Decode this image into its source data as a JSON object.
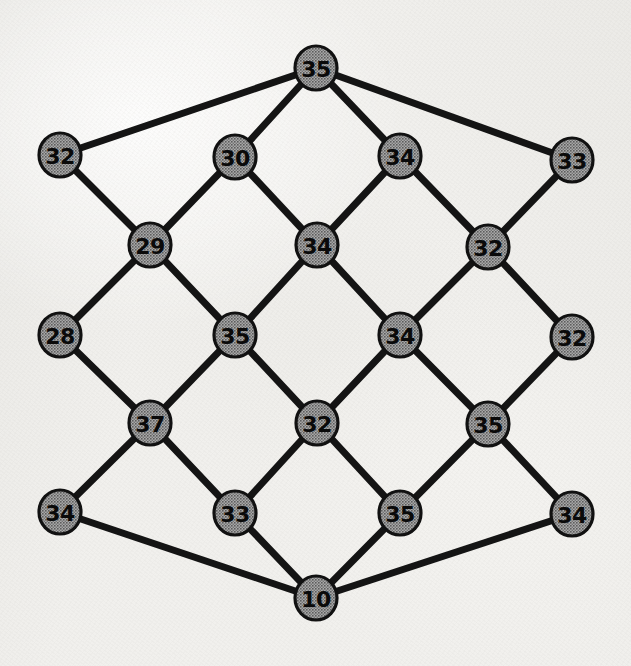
{
  "figure": {
    "kind": "undirected-graph-diagram",
    "medium": "scanned-paper",
    "background_color": "#f1f0ed",
    "node_fill_color": "#8c8c8c",
    "node_stroke_color": "#111111",
    "edge_color": "#141414",
    "label_color": "#0a0a0a",
    "node_radius": 21,
    "edge_width": 7,
    "node_count": 21,
    "edge_count": 36,
    "width": 631,
    "height": 666
  },
  "chart_data": {
    "type": "diagram",
    "title": "",
    "xlabel": "",
    "ylabel": "",
    "layout": "diamond-lattice",
    "rows": 7,
    "nodes": [
      {
        "id": "n0",
        "label": "35",
        "value": 35,
        "x": 316,
        "y": 68,
        "row": 0,
        "col": 0
      },
      {
        "id": "n1",
        "label": "32",
        "value": 32,
        "x": 60,
        "y": 155,
        "row": 1,
        "col": 0
      },
      {
        "id": "n2",
        "label": "30",
        "value": 30,
        "x": 235,
        "y": 157,
        "row": 1,
        "col": 1
      },
      {
        "id": "n3",
        "label": "34",
        "value": 34,
        "x": 400,
        "y": 156,
        "row": 1,
        "col": 2
      },
      {
        "id": "n4",
        "label": "33",
        "value": 33,
        "x": 572,
        "y": 160,
        "row": 1,
        "col": 3
      },
      {
        "id": "n5",
        "label": "29",
        "value": 29,
        "x": 150,
        "y": 245,
        "row": 2,
        "col": 0
      },
      {
        "id": "n6",
        "label": "34",
        "value": 34,
        "x": 317,
        "y": 245,
        "row": 2,
        "col": 1
      },
      {
        "id": "n7",
        "label": "32",
        "value": 32,
        "x": 488,
        "y": 247,
        "row": 2,
        "col": 2
      },
      {
        "id": "n8",
        "label": "28",
        "value": 28,
        "x": 60,
        "y": 335,
        "row": 3,
        "col": 0
      },
      {
        "id": "n9",
        "label": "35",
        "value": 35,
        "x": 235,
        "y": 335,
        "row": 3,
        "col": 1
      },
      {
        "id": "n10",
        "label": "34",
        "value": 34,
        "x": 400,
        "y": 335,
        "row": 3,
        "col": 2
      },
      {
        "id": "n11",
        "label": "32",
        "value": 32,
        "x": 572,
        "y": 337,
        "row": 3,
        "col": 3
      },
      {
        "id": "n12",
        "label": "37",
        "value": 37,
        "x": 150,
        "y": 423,
        "row": 4,
        "col": 0
      },
      {
        "id": "n13",
        "label": "32",
        "value": 32,
        "x": 317,
        "y": 423,
        "row": 4,
        "col": 1
      },
      {
        "id": "n14",
        "label": "35",
        "value": 35,
        "x": 488,
        "y": 424,
        "row": 4,
        "col": 2
      },
      {
        "id": "n15",
        "label": "34",
        "value": 34,
        "x": 60,
        "y": 512,
        "row": 5,
        "col": 0
      },
      {
        "id": "n16",
        "label": "33",
        "value": 33,
        "x": 235,
        "y": 513,
        "row": 5,
        "col": 1
      },
      {
        "id": "n17",
        "label": "35",
        "value": 35,
        "x": 400,
        "y": 513,
        "row": 5,
        "col": 2
      },
      {
        "id": "n18",
        "label": "34",
        "value": 34,
        "x": 572,
        "y": 514,
        "row": 5,
        "col": 3
      },
      {
        "id": "n19",
        "label": "10",
        "value": 10,
        "x": 316,
        "y": 598,
        "row": 6,
        "col": 0
      }
    ],
    "edges": [
      {
        "from": "n0",
        "to": "n1"
      },
      {
        "from": "n0",
        "to": "n2"
      },
      {
        "from": "n0",
        "to": "n3"
      },
      {
        "from": "n0",
        "to": "n4"
      },
      {
        "from": "n1",
        "to": "n5"
      },
      {
        "from": "n2",
        "to": "n5"
      },
      {
        "from": "n2",
        "to": "n6"
      },
      {
        "from": "n3",
        "to": "n6"
      },
      {
        "from": "n3",
        "to": "n7"
      },
      {
        "from": "n4",
        "to": "n7"
      },
      {
        "from": "n5",
        "to": "n8"
      },
      {
        "from": "n5",
        "to": "n9"
      },
      {
        "from": "n6",
        "to": "n9"
      },
      {
        "from": "n6",
        "to": "n10"
      },
      {
        "from": "n7",
        "to": "n10"
      },
      {
        "from": "n7",
        "to": "n11"
      },
      {
        "from": "n8",
        "to": "n12"
      },
      {
        "from": "n9",
        "to": "n12"
      },
      {
        "from": "n9",
        "to": "n13"
      },
      {
        "from": "n10",
        "to": "n13"
      },
      {
        "from": "n10",
        "to": "n14"
      },
      {
        "from": "n11",
        "to": "n14"
      },
      {
        "from": "n12",
        "to": "n15"
      },
      {
        "from": "n12",
        "to": "n16"
      },
      {
        "from": "n13",
        "to": "n16"
      },
      {
        "from": "n13",
        "to": "n17"
      },
      {
        "from": "n14",
        "to": "n17"
      },
      {
        "from": "n14",
        "to": "n18"
      },
      {
        "from": "n15",
        "to": "n19"
      },
      {
        "from": "n16",
        "to": "n19"
      },
      {
        "from": "n17",
        "to": "n19"
      },
      {
        "from": "n18",
        "to": "n19"
      }
    ]
  }
}
